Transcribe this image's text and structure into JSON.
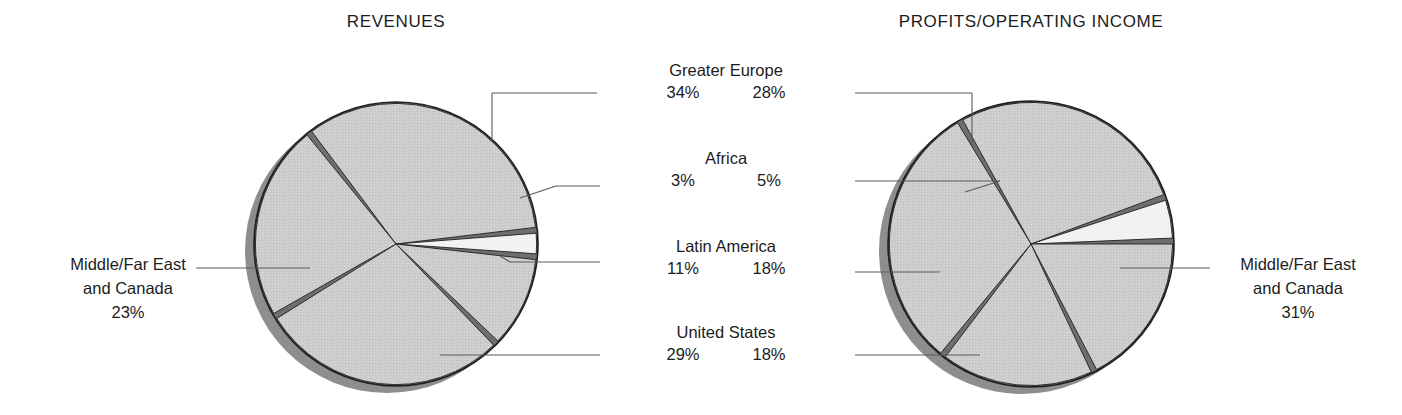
{
  "chart_data": {
    "type": "pie",
    "charts": [
      {
        "id": "revenues",
        "title": "REVENUES",
        "center": [
          396,
          244
        ],
        "radius": 142,
        "categories": [
          "Greater Europe",
          "Middle/Far East and Canada",
          "United States",
          "Latin America",
          "Africa"
        ],
        "values": [
          34,
          23,
          29,
          11,
          3
        ],
        "labels": [
          "34%",
          "23%",
          "29%",
          "11%",
          "3%"
        ]
      },
      {
        "id": "profits",
        "title": "PROFITS/OPERATING INCOME",
        "center": [
          1031,
          244
        ],
        "radius": 143,
        "categories": [
          "Greater Europe",
          "Middle/Far East and Canada",
          "United States",
          "Latin America",
          "Africa"
        ],
        "values": [
          28,
          31,
          18,
          18,
          5
        ],
        "labels": [
          "28%",
          "31%",
          "18%",
          "18%",
          "5%"
        ]
      }
    ],
    "legend_position": "center-callouts",
    "grid": false
  },
  "titles": {
    "left": "REVENUES",
    "right": "PROFITS/OPERATING INCOME"
  },
  "center_labels": [
    {
      "name": "Greater Europe",
      "left_value": "34%",
      "right_value": "28%"
    },
    {
      "name": "Africa",
      "left_value": "3%",
      "right_value": "5%"
    },
    {
      "name": "Latin America",
      "left_value": "11%",
      "right_value": "18%"
    },
    {
      "name": "United States",
      "left_value": "29%",
      "right_value": "18%"
    }
  ],
  "side_labels": {
    "left": {
      "line1": "Middle/Far East",
      "line2": "and Canada",
      "value": "23%"
    },
    "right": {
      "line1": "Middle/Far East",
      "line2": "and Canada",
      "value": "31%"
    }
  },
  "colors": {
    "slice_fill": "#cdcdcd",
    "slice_fill_light": "#f2f2f2",
    "gap": "#6e6e6e",
    "outline": "#1f1f1f",
    "shadow": "#7a7a7a",
    "text": "#1c1c1c",
    "leader_line": "#5a5a5a",
    "background": "#ffffff"
  }
}
